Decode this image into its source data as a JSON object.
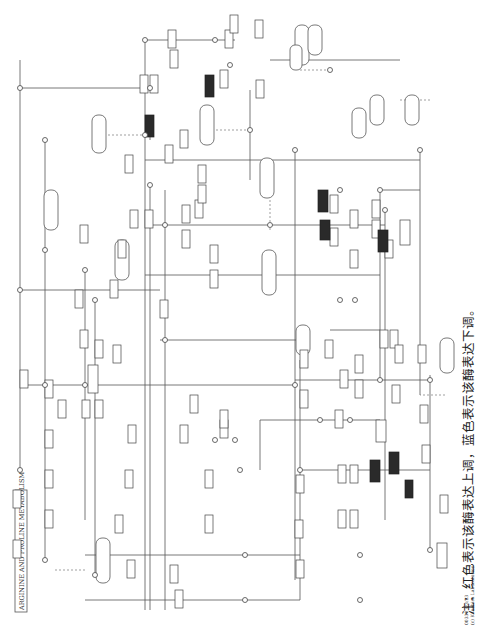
{
  "title": "ARGININE AND PROLINE METABOLISM",
  "caption": "注：红色表示该酶表达上调，蓝色表示该酶表达下调。",
  "footer": [
    "00330 4/3/23",
    "(c) Kanehisa Laboratories"
  ],
  "colors": {
    "line": "#555555",
    "enzyme_border": "#444444",
    "highlighted_enzyme": "#2a2a2a",
    "background": "#ffffff"
  },
  "compounds": [
    "Glutamate",
    "N2-Succinyl-L-glutamate",
    "N2-Succinyl-L-ornithine",
    "N2-Succinyl-L-arginine",
    "Ornithine",
    "Arginine",
    "Citrulline",
    "Carbamoyl-P",
    "Urea",
    "Putrescine",
    "Spermidine",
    "Spermine",
    "Proline",
    "4-Hydroxy-proline",
    "1-Pyrroline-5-carboxylate",
    "L-Glutamate 5-semialdehyde",
    "D-Proline",
    "Glyoxylate",
    "Pyruvate",
    "S-Adenosyl-methionine",
    "4-Guanidino-butanoate",
    "L-Arginine-P",
    "2-Oxoarginine",
    "Agmatine",
    "Creatine",
    "Creatinine",
    "Sarcosine",
    "N-Acetyl-ornithine",
    "4-Acetamido-butanoate",
    "Nitric oxide",
    "Homospermidine"
  ],
  "pathways": [
    "Alanine, aspartate and glutamate metabolism",
    "Arginine biosynthesis",
    "Cysteine and methionine metabolism",
    "Lysine degradation",
    "Glyoxylate and dicarboxylate metabolism",
    "Citrate cycle",
    "Glycine, serine and threonine metabolism",
    "beta-Alanine metabolism",
    "Glutathione metabolism",
    "Pantothenate and CoA biosynthesis",
    "Tropane, piperidine and pyridine alkaloid biosynthesis",
    "Histidine metabolism",
    "Urea cycle",
    "Creatine pathway",
    "Polyamine pathway",
    "ADC pathway",
    "ADH pathway",
    "Degradation and metabolism"
  ],
  "enzymes": {
    "normal": [
      "2.6.1.81",
      "1.2.1.71",
      "3.5.1.96",
      "2.3.1.109",
      "3.5.3.23",
      "2.7.3.3",
      "2.1.4.1",
      "3.5.3.1",
      "3.5.3.6",
      "2.1.3.3",
      "6.3.4.16",
      "2.7.2.2",
      "3.5.3.10",
      "1.14.13.39",
      "4.1.1.17",
      "3.5.1.53",
      "4.1.1.19",
      "2.6.1.13",
      "1.5.1.2",
      "1.5.1.12",
      "4.2.1.77",
      "1.4.1.12",
      "2.1.4.2",
      "2.5.1.16",
      "2.5.1.22",
      "1.5.3.14",
      "2.3.1.57",
      "3.5.1.48",
      "1.2.1.88",
      "1.5.5.2",
      "4.1.3.16",
      "3.4.11.5",
      "3.5.3.4",
      "4.3.1.12",
      "1.4.3.3",
      "PuuA",
      "PuuB",
      "PuuC",
      "PuuD",
      "AST",
      "2.6.1.82",
      "3.5.3.11",
      "1.2.1.54",
      "2.6.1.96",
      "1.13.12.1",
      "3.5.1.4"
    ],
    "highlighted": [
      "1.14.11.2",
      "1.5.3.16",
      "2.6.1.81",
      "4.1.1.50",
      "2.3.1.57",
      "2.5.1.6",
      "1.5.1.11"
    ]
  }
}
